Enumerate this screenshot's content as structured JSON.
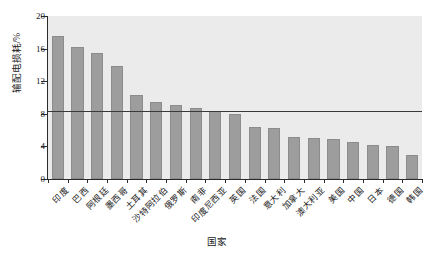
{
  "chart_data": {
    "type": "bar",
    "title": "",
    "xlabel": "国家",
    "ylabel": "输配电损耗/%",
    "ylim": [
      0,
      20
    ],
    "yticks": [
      0,
      4,
      8,
      12,
      16,
      20
    ],
    "grid": false,
    "legend": "none",
    "bar_color": "#9d9d9d",
    "plot_background": "#ebebeb",
    "reference_line": {
      "value": 8.4,
      "orientation": "horizontal",
      "color": "#3a3a3a"
    },
    "categories": [
      "印度",
      "巴西",
      "阿根廷",
      "墨西哥",
      "土耳其",
      "沙特阿拉伯",
      "俄罗斯",
      "南非",
      "印度尼西亚",
      "英国",
      "法国",
      "意大利",
      "加拿大",
      "澳大利亚",
      "美国",
      "中国",
      "日本",
      "德国",
      "韩国"
    ],
    "values": [
      17.6,
      16.2,
      15.5,
      13.9,
      10.3,
      9.4,
      9.1,
      8.7,
      8.4,
      8.0,
      6.4,
      6.2,
      5.1,
      5.0,
      4.9,
      4.6,
      4.2,
      4.0,
      3.0
    ]
  }
}
